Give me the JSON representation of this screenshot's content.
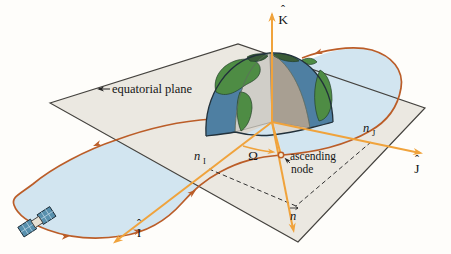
{
  "figure": {
    "labels": {
      "equatorial_plane": "equatorial plane",
      "k_axis": {
        "base": "K",
        "hat": "ˆ"
      },
      "i_axis": {
        "base": "I",
        "hat": "ˆ"
      },
      "j_axis": {
        "base": "J",
        "hat": "ˆ"
      },
      "omega": "Ω",
      "ascending_node_line1": "ascending",
      "ascending_node_line2": "node",
      "n_i": {
        "base": "n",
        "subscript": "I"
      },
      "n_j": {
        "base": "n",
        "subscript": "J"
      },
      "n_vector": {
        "base": "n"
      }
    },
    "colors": {
      "background": "#fefdfa",
      "text": "#151515",
      "axis": "#f0a33c",
      "orbit": "#bb5d28",
      "plane": "#ebe8e1",
      "plane_edge": "#44423e",
      "shading": "#d2e5f0",
      "ocean": "#4e7fa2",
      "land": "#4e8c44",
      "land_dark": "#3a5c38",
      "cut_light": "#d0cec8",
      "cut_dark": "#a89f92",
      "floor": "#dcd8d0",
      "earth_outline": "#22313b",
      "panel": "#5890ad"
    }
  }
}
